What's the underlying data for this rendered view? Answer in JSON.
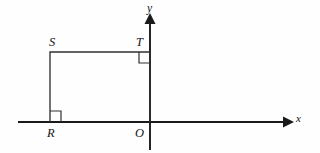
{
  "figure": {
    "kind": "coordinate-plane-geometry-diagram",
    "background_color": "#fefefe",
    "stroke_color": "#1a1a1a",
    "shape_color": "#303030",
    "axes": {
      "x_axis": {
        "label": "x",
        "orientation": "horizontal",
        "start": [
          18,
          122
        ],
        "end": [
          290,
          122
        ],
        "arrow": "right"
      },
      "y_axis": {
        "label": "y",
        "orientation": "vertical",
        "start": [
          150,
          150
        ],
        "end": [
          150,
          18
        ],
        "arrow": "up"
      },
      "origin_label": "O",
      "origin": [
        150,
        122
      ]
    },
    "shape": {
      "type": "rectangle",
      "vertex_labels": [
        "R",
        "S",
        "T",
        "O"
      ],
      "vertices": [
        {
          "label": "R",
          "x": 50,
          "y": 122
        },
        {
          "label": "S",
          "x": 50,
          "y": 52
        },
        {
          "label": "T",
          "x": 150,
          "y": 52
        },
        {
          "label": "O",
          "x": 150,
          "y": 122
        }
      ],
      "right_angle_marks": [
        "R",
        "T"
      ],
      "right_angle_mark_size": 11
    },
    "labels": {
      "S": "S",
      "T": "T",
      "R": "R",
      "O": "O",
      "x": "x",
      "y": "y"
    }
  }
}
